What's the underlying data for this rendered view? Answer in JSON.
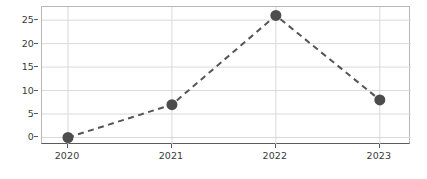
{
  "chart_data": {
    "type": "line",
    "title": "",
    "subtitle": "",
    "xlabel": "",
    "ylabel": "",
    "categories": [
      "2020",
      "2021",
      "2022",
      "2023"
    ],
    "x": [
      2020,
      2021,
      2022,
      2023
    ],
    "values": [
      0,
      7,
      26,
      8
    ],
    "series": [
      {
        "name": "",
        "values": [
          0,
          7,
          26,
          8
        ]
      }
    ],
    "xlim": [
      2019.75,
      2023.3
    ],
    "ylim": [
      -1.6,
      27.8
    ],
    "yticks": [
      0,
      5,
      10,
      15,
      20,
      25
    ],
    "ytick_labels": [
      "0",
      "5",
      "10",
      "15",
      "20",
      "25"
    ],
    "xticks": [
      2020,
      2021,
      2022,
      2023
    ],
    "xtick_labels": [
      "2020",
      "2021",
      "2022",
      "2023"
    ],
    "grid": true,
    "grid_axis": "both",
    "legend": false,
    "legend_position": "none",
    "line_style": "dashed",
    "marker": "circle",
    "marker_size": 11,
    "annotations": []
  },
  "colors": {
    "line": "#555555",
    "marker": "#4d4d4d",
    "grid": "#d9d9d9",
    "frame": "#b8b8b8",
    "axis": "#5a5a5a",
    "tick_text": "#3a3a3a",
    "background": "#ffffff"
  },
  "axes": {
    "y": {
      "ticks": [
        {
          "label": "25",
          "value": 25
        },
        {
          "label": "20",
          "value": 20
        },
        {
          "label": "15",
          "value": 15
        },
        {
          "label": "10",
          "value": 10
        },
        {
          "label": "5",
          "value": 5
        },
        {
          "label": "0",
          "value": 0
        }
      ]
    },
    "x": {
      "ticks": [
        {
          "label": "2020",
          "value": 2020
        },
        {
          "label": "2021",
          "value": 2021
        },
        {
          "label": "2022",
          "value": 2022
        },
        {
          "label": "2023",
          "value": 2023
        }
      ]
    }
  }
}
